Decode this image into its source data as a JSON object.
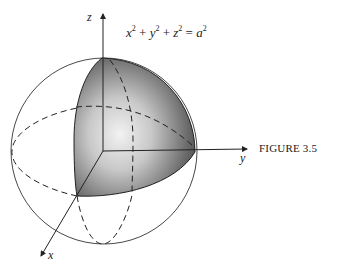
{
  "figure": {
    "caption": "FIGURE 3.5",
    "equation": {
      "terms": [
        "x",
        "y",
        "z"
      ],
      "exponent": "2",
      "rhs": "a",
      "plus": "+",
      "equals": "="
    },
    "axes": {
      "x_label": "x",
      "y_label": "y",
      "z_label": "z"
    }
  }
}
